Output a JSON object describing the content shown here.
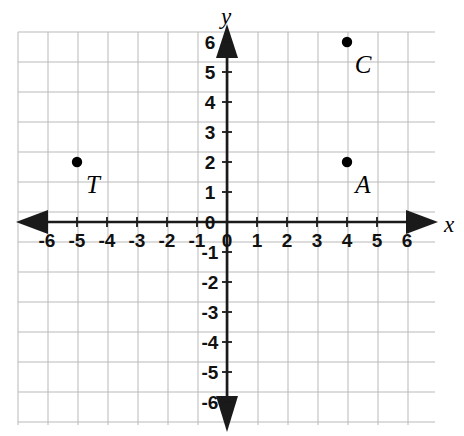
{
  "figure": {
    "kind": "coordinate-plane",
    "background_color": "#ffffff",
    "grid_color": "#b9b9b9",
    "axis_color": "#1a1a1a",
    "point_color": "#000000"
  },
  "axes": {
    "x_name": "x",
    "y_name": "y",
    "x_ticks": [
      "-6",
      "-5",
      "-4",
      "-3",
      "-2",
      "-1",
      "0",
      "1",
      "2",
      "3",
      "4",
      "5",
      "6"
    ],
    "y_ticks": [
      "6",
      "5",
      "4",
      "3",
      "2",
      "1",
      "0",
      "-1",
      "-2",
      "-3",
      "-4",
      "-5",
      "-6"
    ]
  },
  "chart_data": {
    "type": "scatter",
    "title": "",
    "xlabel": "x",
    "ylabel": "y",
    "xlim": [
      -7,
      7
    ],
    "ylim": [
      -7,
      7
    ],
    "grid": true,
    "legend": "none",
    "x_tick_values": [
      -6,
      -5,
      -4,
      -3,
      -2,
      -1,
      0,
      1,
      2,
      3,
      4,
      5,
      6
    ],
    "y_tick_values": [
      6,
      5,
      4,
      3,
      2,
      1,
      0,
      -1,
      -2,
      -3,
      -4,
      -5,
      -6
    ],
    "points": [
      {
        "label": "T",
        "x": -5,
        "y": 2
      },
      {
        "label": "A",
        "x": 4,
        "y": 2
      },
      {
        "label": "C",
        "x": 4,
        "y": 6
      }
    ]
  }
}
